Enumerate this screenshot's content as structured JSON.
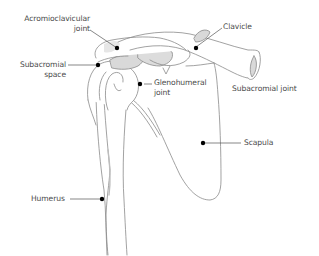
{
  "figure": {
    "type": "anatomical-line-drawing",
    "colors": {
      "outline": "#8a8a8a",
      "bone_fill": "#ffffff",
      "cartilage_fill": "#d9d9d9",
      "leader_line": "#555555",
      "marker_dot": "#000000",
      "label_text": "#4a4a4a"
    }
  },
  "labels": {
    "acromioclavicular": {
      "line1": "Acromioclavicular",
      "line2": "joint"
    },
    "subacromial_space": {
      "line1": "Subacromial",
      "line2": "space"
    },
    "glenohumeral": {
      "line1": "Glenohumeral",
      "line2": "joint"
    },
    "clavicle": {
      "text": "Clavicle"
    },
    "subacromial_joint": {
      "text": "Subacromial joint"
    },
    "scapula": {
      "text": "Scapula"
    },
    "humerus": {
      "text": "Humerus"
    }
  }
}
